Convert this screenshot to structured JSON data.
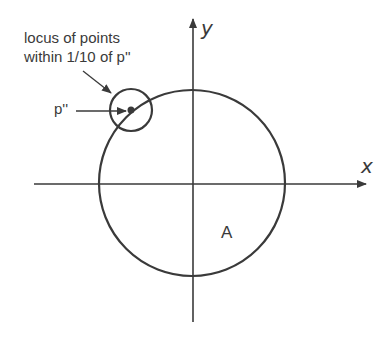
{
  "diagram": {
    "annotation_line1": "locus of points",
    "annotation_line2": "within 1/10 of p''",
    "point_label": "p''",
    "region_label": "A",
    "x_axis_label": "x",
    "y_axis_label": "y",
    "colors": {
      "stroke": "#3a3a3a",
      "background": "#ffffff"
    }
  }
}
